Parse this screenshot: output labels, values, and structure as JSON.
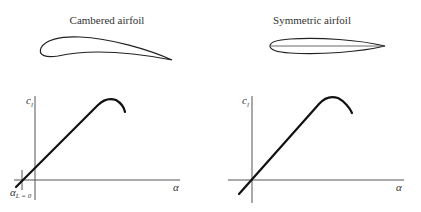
{
  "panels": [
    {
      "title": "Cambered airfoil",
      "airfoil_type": "cambered",
      "y_axis_label": "c",
      "y_axis_sub": "l",
      "x_axis_label": "α",
      "zero_lift_label": "α",
      "zero_lift_sub": "L = 0",
      "line_passes_origin": false
    },
    {
      "title": "Symmetric airfoil",
      "airfoil_type": "symmetric",
      "y_axis_label": "c",
      "y_axis_sub": "l",
      "x_axis_label": "α",
      "line_passes_origin": true
    }
  ]
}
